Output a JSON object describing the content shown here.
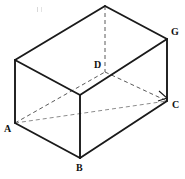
{
  "figure": {
    "type": "geometry-diagram",
    "shape": "rectangular prism",
    "projection": "oblique",
    "background_color": "#ffffff",
    "solid_edge_color": "#1a1a1a",
    "hidden_edge_color": "#8c8c8c",
    "label_color": "#111111",
    "canvas": {
      "width": 185,
      "height": 179
    }
  },
  "vertices": [
    {
      "id": "A",
      "label": "A",
      "x": 15,
      "y": 123,
      "label_x": 4,
      "label_y": 124,
      "visible": true,
      "position": "front-left-bottom"
    },
    {
      "id": "B",
      "label": "B",
      "x": 80,
      "y": 158,
      "label_x": 76,
      "label_y": 163,
      "visible": true,
      "position": "front-bottom"
    },
    {
      "id": "C",
      "label": "C",
      "x": 167,
      "y": 101,
      "label_x": 172,
      "label_y": 100,
      "visible": true,
      "position": "right-bottom"
    },
    {
      "id": "D",
      "label": "D",
      "x": 105,
      "y": 72,
      "label_x": 94,
      "label_y": 60,
      "visible": false,
      "position": "back-bottom-hidden"
    },
    {
      "id": "G",
      "label": "G",
      "x": 167,
      "y": 39,
      "label_x": 171,
      "label_y": 27,
      "visible": true,
      "position": "right-top"
    },
    {
      "id": "E",
      "label": "",
      "x": 15,
      "y": 60,
      "label_x": null,
      "label_y": null,
      "visible": true,
      "position": "left-top"
    },
    {
      "id": "F",
      "label": "",
      "x": 80,
      "y": 95,
      "label_x": null,
      "label_y": null,
      "visible": true,
      "position": "front-top"
    },
    {
      "id": "H",
      "label": "",
      "x": 105,
      "y": 6,
      "label_x": null,
      "label_y": null,
      "visible": true,
      "position": "back-top"
    }
  ],
  "edges": {
    "solid": [
      {
        "name": "edge-E-H",
        "from": "E",
        "to": "H"
      },
      {
        "name": "edge-H-G",
        "from": "H",
        "to": "G"
      },
      {
        "name": "edge-E-F",
        "from": "E",
        "to": "F"
      },
      {
        "name": "edge-F-G",
        "from": "F",
        "to": "G"
      },
      {
        "name": "edge-E-A",
        "from": "E",
        "to": "A"
      },
      {
        "name": "edge-F-B",
        "from": "F",
        "to": "B"
      },
      {
        "name": "edge-G-C",
        "from": "G",
        "to": "C"
      },
      {
        "name": "edge-A-B",
        "from": "A",
        "to": "B"
      },
      {
        "name": "edge-B-C",
        "from": "B",
        "to": "C"
      }
    ],
    "hidden": [
      {
        "name": "edge-H-D",
        "from": "H",
        "to": "D"
      },
      {
        "name": "edge-A-D",
        "from": "A",
        "to": "D"
      },
      {
        "name": "edge-D-C",
        "from": "D",
        "to": "C"
      },
      {
        "name": "diagonal-A-C",
        "from": "A",
        "to": "C"
      }
    ]
  },
  "markers": {
    "right_angle": {
      "name": "right-angle-marker-at-C",
      "at_vertex": "C",
      "points": "159,91 167,98 158,101",
      "description": "right angle mark at vertex C between DC and BC"
    }
  },
  "labels": {
    "A": "A",
    "B": "B",
    "C": "C",
    "D": "D",
    "G": "G"
  }
}
